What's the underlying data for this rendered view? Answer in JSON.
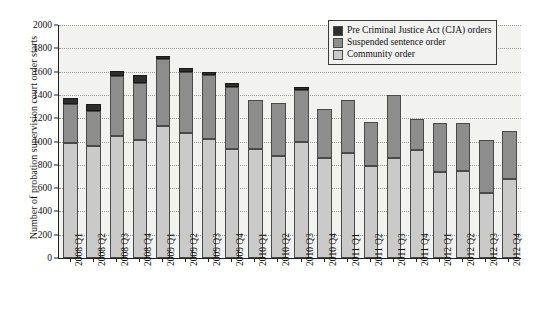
{
  "chart_data": {
    "type": "bar",
    "stacked": true,
    "title": "",
    "xlabel": "",
    "ylabel": "Number of probation supervision court order starts",
    "ylim": [
      0,
      2000
    ],
    "yticks": [
      0,
      200,
      400,
      600,
      800,
      1000,
      1200,
      1400,
      1600,
      1800,
      2000
    ],
    "grid": true,
    "legend_position": "top-right",
    "categories": [
      "2008 Q1",
      "2008 Q2",
      "2008 Q3",
      "2008 Q4",
      "2009 Q1",
      "2009 Q2",
      "2009 Q3",
      "2009 Q4",
      "2010 Q1",
      "2010 Q2",
      "2010 Q3",
      "2010 Q4",
      "2011 Q1",
      "2011 Q2",
      "2011 Q3",
      "2011 Q4",
      "2012 Q1",
      "2012 Q2",
      "2012 Q3",
      "2012 Q4"
    ],
    "series": [
      {
        "name": "Community order",
        "color": "#cacaca",
        "values": [
          985,
          960,
          1045,
          1010,
          1130,
          1070,
          1025,
          935,
          935,
          875,
          1000,
          860,
          905,
          790,
          855,
          930,
          735,
          745,
          560,
          675
        ]
      },
      {
        "name": "Suspended sentence order",
        "color": "#8d8d8d",
        "values": [
          335,
          305,
          515,
          490,
          575,
          525,
          550,
          535,
          420,
          455,
          440,
          420,
          455,
          375,
          545,
          260,
          425,
          410,
          455,
          415
        ]
      },
      {
        "name": "Pre Criminal Justice Act (CJA) orders",
        "color": "#2e2e2e",
        "values": [
          55,
          60,
          45,
          75,
          30,
          35,
          25,
          35,
          0,
          0,
          25,
          0,
          0,
          0,
          0,
          0,
          0,
          0,
          0,
          0
        ]
      }
    ],
    "totals": [
      1375,
      1325,
      1605,
      1575,
      1735,
      1630,
      1600,
      1505,
      1355,
      1330,
      1465,
      1280,
      1360,
      1165,
      1400,
      1190,
      1160,
      1155,
      1015,
      1090
    ]
  },
  "legend": {
    "items": [
      {
        "label": "Pre Criminal Justice Act (CJA) orders",
        "color": "#2e2e2e"
      },
      {
        "label": "Suspended sentence order",
        "color": "#8d8d8d"
      },
      {
        "label": "Community order",
        "color": "#cacaca"
      }
    ]
  }
}
